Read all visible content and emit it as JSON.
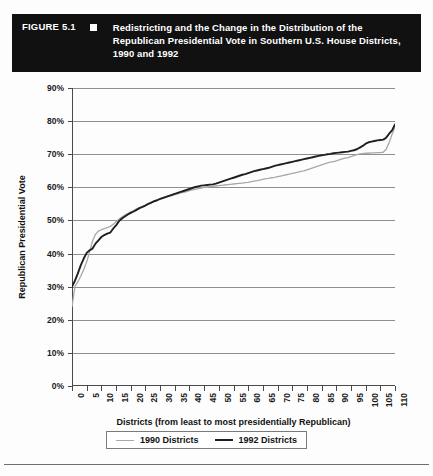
{
  "figure": {
    "number": "FIGURE 5.1",
    "bullet_icon": "square-bullet-icon",
    "title": "Redistricting and the Change in the Distribution of the Republican Presidential Vote in Southern U.S. House Districts, 1990 and 1992",
    "title_bar_color": "#111111",
    "title_text_color": "#ffffff"
  },
  "chart_data": {
    "type": "line",
    "title": "Redistricting and the Change in the Distribution of the Republican Presidential Vote in Southern U.S. House Districts, 1990 and 1992",
    "xlabel": "Districts (from least to most presidentially Republican)",
    "ylabel": "Republican Presidential Vote",
    "xlim": [
      0,
      110
    ],
    "ylim": [
      0,
      90
    ],
    "grid": true,
    "legend_position": "bottom-center",
    "y_tick_labels": [
      "0%",
      "10%",
      "20%",
      "30%",
      "40%",
      "50%",
      "60%",
      "70%",
      "80%",
      "90%"
    ],
    "y_ticks": [
      0,
      10,
      20,
      30,
      40,
      50,
      60,
      70,
      80,
      90
    ],
    "x_tick_labels": [
      "0",
      "5",
      "10",
      "15",
      "20",
      "25",
      "30",
      "35",
      "40",
      "45",
      "50",
      "55",
      "60",
      "65",
      "70",
      "75",
      "80",
      "85",
      "90",
      "95",
      "100",
      "105",
      "110"
    ],
    "x_ticks": [
      0,
      5,
      10,
      15,
      20,
      25,
      30,
      35,
      40,
      45,
      50,
      55,
      60,
      65,
      70,
      75,
      80,
      85,
      90,
      95,
      100,
      105,
      110
    ],
    "x": [
      0,
      1,
      2,
      3,
      4,
      5,
      6,
      7,
      8,
      9,
      10,
      11,
      12,
      13,
      14,
      15,
      16,
      17,
      18,
      19,
      20,
      21,
      22,
      23,
      24,
      25,
      26,
      27,
      28,
      29,
      30,
      31,
      32,
      33,
      34,
      35,
      36,
      37,
      38,
      39,
      40,
      41,
      42,
      43,
      44,
      45,
      46,
      47,
      48,
      49,
      50,
      51,
      52,
      53,
      54,
      55,
      56,
      57,
      58,
      59,
      60,
      61,
      62,
      63,
      64,
      65,
      66,
      67,
      68,
      69,
      70,
      71,
      72,
      73,
      74,
      75,
      76,
      77,
      78,
      79,
      80,
      81,
      82,
      83,
      84,
      85,
      86,
      87,
      88,
      89,
      90,
      91,
      92,
      93,
      94,
      95,
      96,
      97,
      98,
      99,
      100,
      101,
      102,
      103,
      104,
      105,
      106,
      107,
      108,
      109,
      110
    ],
    "series": [
      {
        "name": "1990 Districts",
        "color": "#a8a8a8",
        "values": [
          24.0,
          30.0,
          31.5,
          33.2,
          35.2,
          37.5,
          40.5,
          43.8,
          45.8,
          46.8,
          47.2,
          47.5,
          47.8,
          48.2,
          48.8,
          49.6,
          50.4,
          51.0,
          51.6,
          52.1,
          52.6,
          53.0,
          53.5,
          53.9,
          54.2,
          54.6,
          55.0,
          55.4,
          55.8,
          56.1,
          56.4,
          56.7,
          57.0,
          57.3,
          57.5,
          57.8,
          58.0,
          58.3,
          58.5,
          58.7,
          59.0,
          59.2,
          59.4,
          59.6,
          59.8,
          60.0,
          60.1,
          60.2,
          60.3,
          60.4,
          60.5,
          60.6,
          60.7,
          60.8,
          60.9,
          61.0,
          61.1,
          61.2,
          61.3,
          61.4,
          61.5,
          61.7,
          61.9,
          62.0,
          62.2,
          62.4,
          62.6,
          62.7,
          62.9,
          63.0,
          63.2,
          63.4,
          63.6,
          63.8,
          64.0,
          64.2,
          64.4,
          64.6,
          64.8,
          65.0,
          65.3,
          65.6,
          65.9,
          66.2,
          66.5,
          66.8,
          67.1,
          67.4,
          67.6,
          67.8,
          68.0,
          68.3,
          68.6,
          68.8,
          69.0,
          69.3,
          69.6,
          69.9,
          70.1,
          70.2,
          70.3,
          70.3,
          70.4,
          70.4,
          70.5,
          70.5,
          70.6,
          71.5,
          73.5,
          76.0,
          78.2
        ]
      },
      {
        "name": "1992 Districts",
        "color": "#1f1f1f",
        "values": [
          30.0,
          31.8,
          34.0,
          36.5,
          38.5,
          40.2,
          41.0,
          41.5,
          43.0,
          44.0,
          45.0,
          45.6,
          46.0,
          46.3,
          47.5,
          48.5,
          49.8,
          50.6,
          51.2,
          51.8,
          52.3,
          52.7,
          53.2,
          53.7,
          54.1,
          54.5,
          55.0,
          55.4,
          55.8,
          56.1,
          56.5,
          56.8,
          57.1,
          57.4,
          57.7,
          58.0,
          58.3,
          58.6,
          58.9,
          59.2,
          59.5,
          59.8,
          60.1,
          60.3,
          60.5,
          60.6,
          60.7,
          60.8,
          60.9,
          61.1,
          61.4,
          61.7,
          62.0,
          62.3,
          62.6,
          62.9,
          63.2,
          63.5,
          63.8,
          64.0,
          64.3,
          64.6,
          64.9,
          65.1,
          65.3,
          65.5,
          65.7,
          65.9,
          66.2,
          66.5,
          66.7,
          66.9,
          67.1,
          67.3,
          67.5,
          67.7,
          67.9,
          68.1,
          68.3,
          68.5,
          68.7,
          68.9,
          69.1,
          69.3,
          69.5,
          69.7,
          69.8,
          70.0,
          70.1,
          70.3,
          70.4,
          70.5,
          70.6,
          70.7,
          70.8,
          71.0,
          71.2,
          71.5,
          72.0,
          72.5,
          73.2,
          73.6,
          73.8,
          74.0,
          74.2,
          74.3,
          74.4,
          75.0,
          76.2,
          77.2,
          79.0
        ]
      }
    ]
  },
  "legend": {
    "items": [
      {
        "label": "1990 Districts",
        "color": "#a8a8a8",
        "width": 1.6
      },
      {
        "label": "1992 Districts",
        "color": "#1f1f1f",
        "width": 2.2
      }
    ]
  }
}
